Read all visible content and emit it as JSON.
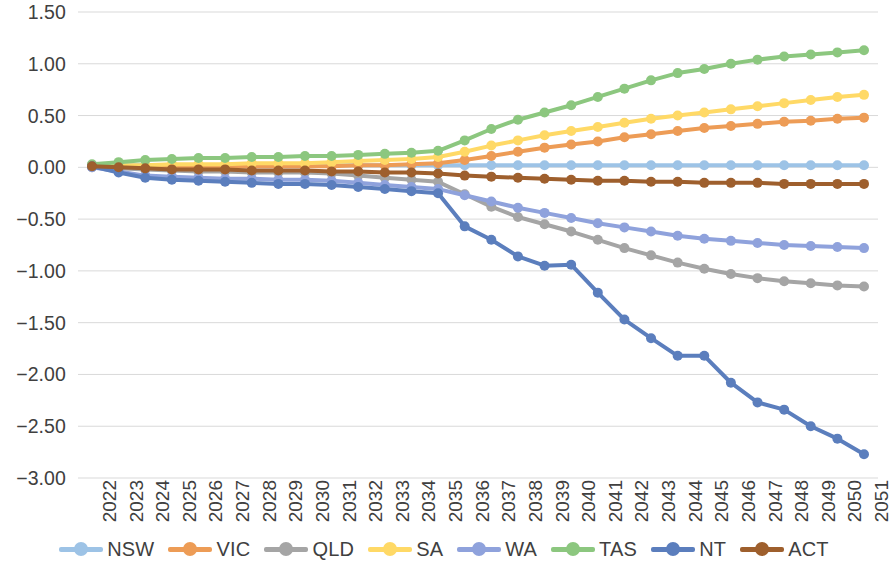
{
  "chart_data": {
    "type": "line",
    "title": "",
    "subtitle": "",
    "xlabel": "",
    "ylabel": "",
    "grid": true,
    "legend_position": "bottom",
    "ylim": [
      -3.0,
      1.5
    ],
    "ytick_step": 0.5,
    "ytick_labels": [
      "1.50",
      "1.00",
      "0.50",
      "0.00",
      "-0.50",
      "-1.00",
      "-1.50",
      "-2.00",
      "-2.50",
      "-3.00"
    ],
    "ytick_values": [
      1.5,
      1.0,
      0.5,
      0.0,
      -0.5,
      -1.0,
      -1.5,
      -2.0,
      -2.5,
      -3.0
    ],
    "categories": [
      "2022",
      "2023",
      "2024",
      "2025",
      "2026",
      "2027",
      "2028",
      "2029",
      "2030",
      "2031",
      "2032",
      "2033",
      "2034",
      "2035",
      "2036",
      "2037",
      "2038",
      "2039",
      "2040",
      "2041",
      "2042",
      "2043",
      "2044",
      "2045",
      "2046",
      "2047",
      "2048",
      "2049",
      "2050",
      "2051"
    ],
    "series": [
      {
        "name": "NSW",
        "color": "#9DC3E6",
        "values": [
          0.02,
          0.02,
          0.02,
          0.02,
          0.02,
          0.02,
          0.02,
          0.02,
          0.02,
          0.02,
          0.02,
          0.02,
          0.02,
          0.02,
          0.02,
          0.02,
          0.02,
          0.02,
          0.02,
          0.02,
          0.02,
          0.02,
          0.02,
          0.02,
          0.02,
          0.02,
          0.02,
          0.02,
          0.02,
          0.02
        ]
      },
      {
        "name": "VIC",
        "color": "#ED9C56",
        "values": [
          0.02,
          0.01,
          0.01,
          0.01,
          0.01,
          0.01,
          0.01,
          0.01,
          0.01,
          0.01,
          0.02,
          0.02,
          0.03,
          0.04,
          0.07,
          0.11,
          0.15,
          0.19,
          0.22,
          0.25,
          0.29,
          0.32,
          0.35,
          0.38,
          0.4,
          0.42,
          0.44,
          0.45,
          0.47,
          0.48
        ]
      },
      {
        "name": "QLD",
        "color": "#A5A5A5",
        "values": [
          0.0,
          -0.01,
          -0.02,
          -0.03,
          -0.04,
          -0.04,
          -0.05,
          -0.05,
          -0.05,
          -0.06,
          -0.08,
          -0.1,
          -0.12,
          -0.14,
          -0.26,
          -0.38,
          -0.48,
          -0.55,
          -0.62,
          -0.7,
          -0.78,
          -0.85,
          -0.92,
          -0.98,
          -1.03,
          -1.07,
          -1.1,
          -1.12,
          -1.14,
          -1.15
        ]
      },
      {
        "name": "SA",
        "color": "#FFD966",
        "values": [
          0.02,
          0.02,
          0.02,
          0.03,
          0.03,
          0.03,
          0.04,
          0.04,
          0.04,
          0.05,
          0.06,
          0.07,
          0.08,
          0.1,
          0.15,
          0.21,
          0.26,
          0.31,
          0.35,
          0.39,
          0.43,
          0.47,
          0.5,
          0.53,
          0.56,
          0.59,
          0.62,
          0.65,
          0.68,
          0.7
        ]
      },
      {
        "name": "WA",
        "color": "#8FA2DC",
        "values": [
          0.0,
          -0.04,
          -0.08,
          -0.09,
          -0.1,
          -0.11,
          -0.11,
          -0.12,
          -0.12,
          -0.13,
          -0.15,
          -0.17,
          -0.19,
          -0.21,
          -0.27,
          -0.33,
          -0.39,
          -0.44,
          -0.49,
          -0.54,
          -0.58,
          -0.62,
          -0.66,
          -0.69,
          -0.71,
          -0.73,
          -0.75,
          -0.76,
          -0.77,
          -0.78
        ]
      },
      {
        "name": "TAS",
        "color": "#8CC77F",
        "values": [
          0.03,
          0.05,
          0.07,
          0.08,
          0.09,
          0.09,
          0.1,
          0.1,
          0.11,
          0.11,
          0.12,
          0.13,
          0.14,
          0.16,
          0.26,
          0.37,
          0.46,
          0.53,
          0.6,
          0.68,
          0.76,
          0.84,
          0.91,
          0.95,
          1.0,
          1.04,
          1.07,
          1.09,
          1.11,
          1.13
        ]
      },
      {
        "name": "NT",
        "color": "#5B7EBD",
        "values": [
          0.01,
          -0.05,
          -0.1,
          -0.12,
          -0.13,
          -0.14,
          -0.15,
          -0.16,
          -0.16,
          -0.17,
          -0.19,
          -0.21,
          -0.23,
          -0.25,
          -0.57,
          -0.7,
          -0.86,
          -0.95,
          -0.94,
          -1.21,
          -1.47,
          -1.65,
          -1.82,
          -1.82,
          -2.08,
          -2.27,
          -2.34,
          -2.5,
          -2.62,
          -2.77
        ]
      },
      {
        "name": "ACT",
        "color": "#9E5F2D",
        "values": [
          0.01,
          0.0,
          -0.01,
          -0.02,
          -0.02,
          -0.02,
          -0.03,
          -0.03,
          -0.03,
          -0.04,
          -0.04,
          -0.05,
          -0.05,
          -0.06,
          -0.08,
          -0.09,
          -0.1,
          -0.11,
          -0.12,
          -0.13,
          -0.13,
          -0.14,
          -0.14,
          -0.15,
          -0.15,
          -0.15,
          -0.16,
          -0.16,
          -0.16,
          -0.16
        ]
      }
    ]
  },
  "legend": {
    "items": [
      {
        "label": "NSW",
        "color": "#9DC3E6"
      },
      {
        "label": "VIC",
        "color": "#ED9C56"
      },
      {
        "label": "QLD",
        "color": "#A5A5A5"
      },
      {
        "label": "SA",
        "color": "#FFD966"
      },
      {
        "label": "WA",
        "color": "#8FA2DC"
      },
      {
        "label": "TAS",
        "color": "#8CC77F"
      },
      {
        "label": "NT",
        "color": "#5B7EBD"
      },
      {
        "label": "ACT",
        "color": "#9E5F2D"
      }
    ]
  },
  "colors": {
    "gridline": "#D9D9D9",
    "axis_text": "#404040",
    "background": "#FFFFFF"
  }
}
